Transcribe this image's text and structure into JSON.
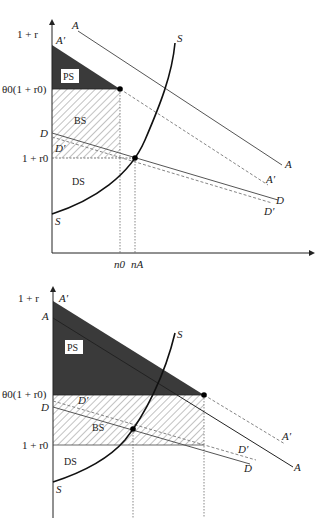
{
  "header_fragment": "",
  "colors": {
    "axis": "#222222",
    "line": "#555555",
    "dashed": "#777777",
    "ps_fill": "#3a3a3a",
    "hatch": "#777777",
    "dot": "#000000"
  },
  "top_chart": {
    "y_axis_label": "1 + r",
    "labels": {
      "A_top": "A",
      "A_prime_axis": "A′",
      "theta": "θ0(1 + r0)",
      "D_axis": "D",
      "D_prime_inner": "D′",
      "one_r0": "1 + r0",
      "S_bottom": "S",
      "S_top": "S",
      "A_end": "A",
      "A_prime_end": "A′",
      "D_end": "D",
      "D_prime_end": "D′",
      "n0": "n0",
      "nA": "nA"
    },
    "regions": {
      "PS": "PS",
      "BS": "BS",
      "DS": "DS"
    }
  },
  "bottom_chart": {
    "y_axis_label": "1 + r",
    "labels": {
      "A_prime_axis": "A′",
      "A_axis": "A",
      "theta": "θ0(1 + r0)",
      "D_axis": "D",
      "D_prime_inner": "D′",
      "one_r0": "1 + r0",
      "S_bottom": "S",
      "S_top": "S",
      "A_prime_end": "A′",
      "A_end": "A",
      "D_prime_end": "D′",
      "D_end": "D"
    },
    "regions": {
      "PS": "PS",
      "BS": "BS",
      "DS": "DS"
    }
  }
}
